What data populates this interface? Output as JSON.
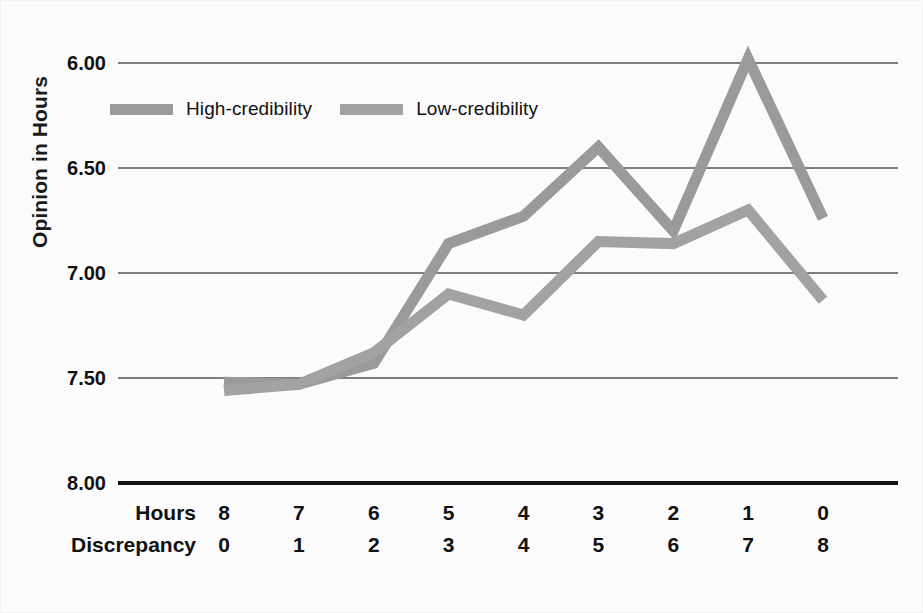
{
  "figure": {
    "background": "#fbfbfb",
    "axis_color": "#111111",
    "gridline_color": "#555555",
    "series_colors": {
      "high_credibility": "#9a9a9a",
      "low_credibility": "#a2a2a2"
    }
  },
  "yaxis": {
    "title": "Opinion in Hours",
    "ticks": [
      "6.00",
      "6.50",
      "7.00",
      "7.50",
      "8.00"
    ]
  },
  "xaxis": {
    "row_labels": [
      "Hours",
      "Discrepancy"
    ],
    "hours": [
      "8",
      "7",
      "6",
      "5",
      "4",
      "3",
      "2",
      "1",
      "0"
    ],
    "discrepancy": [
      "0",
      "1",
      "2",
      "3",
      "4",
      "5",
      "6",
      "7",
      "8"
    ]
  },
  "legend": {
    "items": [
      {
        "label": "High-credibility",
        "color": "#9a9a9a"
      },
      {
        "label": "Low-credibility",
        "color": "#a2a2a2"
      }
    ]
  },
  "chart_data": {
    "type": "line",
    "title": "",
    "xlabel": "Hours / Discrepancy",
    "ylabel": "Opinion in Hours",
    "categories": [
      "8",
      "7",
      "6",
      "5",
      "4",
      "3",
      "2",
      "1",
      "0"
    ],
    "x_secondary": [
      "0",
      "1",
      "2",
      "3",
      "4",
      "5",
      "6",
      "7",
      "8"
    ],
    "ylim": [
      8.0,
      6.0
    ],
    "y_inverted": true,
    "yticks": [
      6.0,
      6.5,
      7.0,
      7.5,
      8.0
    ],
    "grid": true,
    "legend_position": "top-left-inside",
    "series": [
      {
        "name": "High-credibility",
        "color": "#9a9a9a",
        "values": [
          7.52,
          7.53,
          7.43,
          6.86,
          6.73,
          6.4,
          6.8,
          5.98,
          6.74
        ]
      },
      {
        "name": "Low-credibility",
        "color": "#a2a2a2",
        "values": [
          7.56,
          7.53,
          7.38,
          7.1,
          7.2,
          6.85,
          6.86,
          6.7,
          7.13
        ]
      }
    ]
  }
}
